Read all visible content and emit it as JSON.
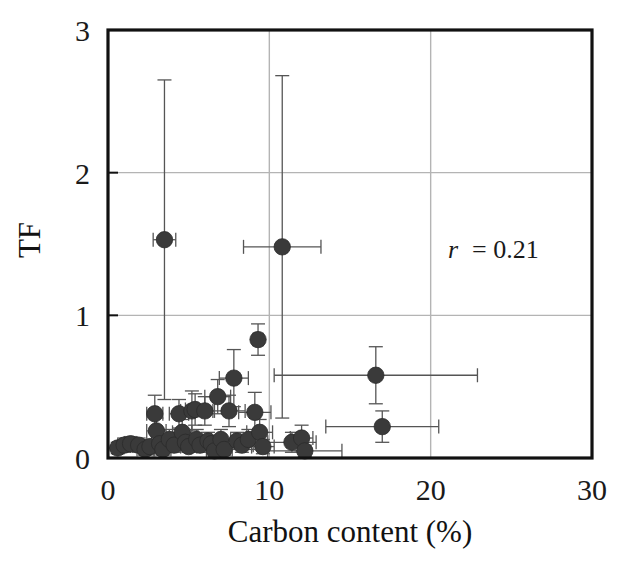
{
  "chart_data": {
    "type": "scatter",
    "title": "",
    "xlabel": "Carbon content (%)",
    "ylabel": "TF",
    "xlim": [
      0,
      30
    ],
    "ylim": [
      0,
      3
    ],
    "xticks": [
      0,
      10,
      20,
      30
    ],
    "yticks": [
      0,
      1,
      2,
      3
    ],
    "xtick_labels": [
      "0",
      "10",
      "20",
      "30"
    ],
    "ytick_labels": [
      "0",
      "1",
      "2",
      "3"
    ],
    "grid": "both",
    "gridlines_x": [
      10,
      20
    ],
    "gridlines_y": [
      1,
      2
    ],
    "legend": "none",
    "marker": "filled-circle",
    "marker_color": "#3a3a3a",
    "errorbars": "x and y",
    "annotations": [
      {
        "text_italic": "r",
        "text": "= 0.21",
        "x": 22.5,
        "y": 1.25
      }
    ],
    "points": [
      {
        "x": 0.6,
        "y": 0.07,
        "xerr": 0.3,
        "yerr": 0.04
      },
      {
        "x": 1.0,
        "y": 0.09,
        "xerr": 0.4,
        "yerr": 0.05
      },
      {
        "x": 1.4,
        "y": 0.1,
        "xerr": 0.4,
        "yerr": 0.05
      },
      {
        "x": 1.9,
        "y": 0.09,
        "xerr": 0.5,
        "yerr": 0.05
      },
      {
        "x": 2.3,
        "y": 0.06,
        "xerr": 0.5,
        "yerr": 0.04
      },
      {
        "x": 2.6,
        "y": 0.08,
        "xerr": 0.5,
        "yerr": 0.05
      },
      {
        "x": 2.9,
        "y": 0.31,
        "xerr": 0.5,
        "yerr": 0.13
      },
      {
        "x": 3.0,
        "y": 0.19,
        "xerr": 0.6,
        "yerr": 0.09
      },
      {
        "x": 3.2,
        "y": 0.1,
        "xerr": 0.5,
        "yerr": 0.06
      },
      {
        "x": 3.4,
        "y": 0.06,
        "xerr": 0.5,
        "yerr": 0.04
      },
      {
        "x": 3.5,
        "y": 1.53,
        "xerr": 0.7,
        "yerr": 1.12
      },
      {
        "x": 3.8,
        "y": 0.13,
        "xerr": 0.6,
        "yerr": 0.07
      },
      {
        "x": 4.1,
        "y": 0.09,
        "xerr": 0.5,
        "yerr": 0.05
      },
      {
        "x": 4.4,
        "y": 0.31,
        "xerr": 0.6,
        "yerr": 0.1
      },
      {
        "x": 4.6,
        "y": 0.18,
        "xerr": 0.6,
        "yerr": 0.09
      },
      {
        "x": 4.8,
        "y": 0.11,
        "xerr": 0.5,
        "yerr": 0.06
      },
      {
        "x": 5.0,
        "y": 0.08,
        "xerr": 0.5,
        "yerr": 0.04
      },
      {
        "x": 5.2,
        "y": 0.33,
        "xerr": 0.7,
        "yerr": 0.14
      },
      {
        "x": 5.4,
        "y": 0.34,
        "xerr": 0.6,
        "yerr": 0.11
      },
      {
        "x": 5.5,
        "y": 0.13,
        "xerr": 0.6,
        "yerr": 0.07
      },
      {
        "x": 5.7,
        "y": 0.09,
        "xerr": 0.5,
        "yerr": 0.05
      },
      {
        "x": 6.0,
        "y": 0.33,
        "xerr": 0.6,
        "yerr": 0.1
      },
      {
        "x": 6.2,
        "y": 0.12,
        "xerr": 0.6,
        "yerr": 0.06
      },
      {
        "x": 6.4,
        "y": 0.1,
        "xerr": 0.5,
        "yerr": 0.05
      },
      {
        "x": 6.6,
        "y": 0.05,
        "xerr": 0.5,
        "yerr": 0.04
      },
      {
        "x": 6.8,
        "y": 0.43,
        "xerr": 0.8,
        "yerr": 0.12
      },
      {
        "x": 7.0,
        "y": 0.13,
        "xerr": 0.6,
        "yerr": 0.07
      },
      {
        "x": 7.2,
        "y": 0.06,
        "xerr": 0.5,
        "yerr": 0.04
      },
      {
        "x": 7.5,
        "y": 0.33,
        "xerr": 1.0,
        "yerr": 0.11
      },
      {
        "x": 7.8,
        "y": 0.56,
        "xerr": 0.9,
        "yerr": 0.2
      },
      {
        "x": 8.0,
        "y": 0.12,
        "xerr": 0.8,
        "yerr": 0.06
      },
      {
        "x": 8.3,
        "y": 0.09,
        "xerr": 0.7,
        "yerr": 0.05
      },
      {
        "x": 8.7,
        "y": 0.13,
        "xerr": 0.8,
        "yerr": 0.07
      },
      {
        "x": 9.1,
        "y": 0.32,
        "xerr": 1.0,
        "yerr": 0.14
      },
      {
        "x": 9.3,
        "y": 0.83,
        "xerr": 0.3,
        "yerr": 0.11
      },
      {
        "x": 9.4,
        "y": 0.18,
        "xerr": 0.8,
        "yerr": 0.09
      },
      {
        "x": 9.6,
        "y": 0.08,
        "xerr": 0.7,
        "yerr": 0.05
      },
      {
        "x": 10.8,
        "y": 1.48,
        "xerr": 2.4,
        "yerr": 1.2
      },
      {
        "x": 11.4,
        "y": 0.11,
        "xerr": 1.5,
        "yerr": 0.07
      },
      {
        "x": 12.0,
        "y": 0.14,
        "xerr": 0.7,
        "yerr": 0.09
      },
      {
        "x": 12.2,
        "y": 0.05,
        "xerr": 2.3,
        "yerr": 0.04
      },
      {
        "x": 16.6,
        "y": 0.58,
        "xerr": 6.3,
        "yerr": 0.2
      },
      {
        "x": 17.0,
        "y": 0.22,
        "xerr": 3.5,
        "yerr": 0.11
      }
    ]
  },
  "axis": {
    "x_title": "Carbon content (%)",
    "y_title": "TF",
    "x_ticks": [
      "0",
      "10",
      "20",
      "30"
    ],
    "y_ticks": [
      "0",
      "1",
      "2",
      "3"
    ]
  },
  "annotation": {
    "symbol": "r",
    "value": "= 0.21"
  },
  "colors": {
    "marker": "#3a3a3a",
    "axis": "#111111",
    "grid": "#b4b4b4",
    "errorbar": "#555555",
    "background": "#ffffff"
  }
}
